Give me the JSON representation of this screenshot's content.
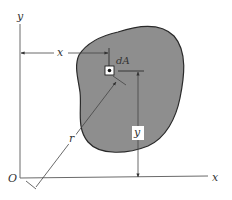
{
  "diagram": {
    "type": "moment-of-inertia-area-element",
    "colors": {
      "region_fill": "#8e8e8e",
      "region_stroke": "#2a2a2a",
      "axis": "#6a6a6a",
      "dimension_line": "#444444",
      "label": "#333333",
      "background": "#ffffff"
    },
    "labels": {
      "origin": "O",
      "x_axis": "x",
      "y_axis": "y",
      "x_distance": "x",
      "y_distance": "y",
      "radius": "r",
      "element": "dA"
    }
  }
}
